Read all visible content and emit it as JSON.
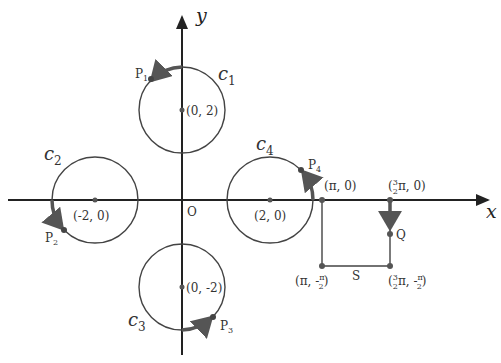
{
  "axes": {
    "x_label": "x",
    "y_label": "y",
    "origin_label": "O"
  },
  "circles": [
    {
      "name": "c",
      "sub": "1",
      "center_label": "(0, 2)",
      "point": "P",
      "point_sub": "1"
    },
    {
      "name": "c",
      "sub": "2",
      "center_label": "(-2, 0)",
      "point": "P",
      "point_sub": "2"
    },
    {
      "name": "c",
      "sub": "3",
      "center_label": "(0, -2)",
      "point": "P",
      "point_sub": "3"
    },
    {
      "name": "c",
      "sub": "4",
      "center_label": "(2, 0)",
      "point": "P",
      "point_sub": "4"
    }
  ],
  "rectangle": {
    "top_left": "(π, 0)",
    "top_right_pre": "(",
    "top_right_frac_num": "3",
    "top_right_frac_den": "2",
    "top_right_post": "π, 0)",
    "bottom_left_pre": "(π, -",
    "bottom_left_frac_num": "π",
    "bottom_left_frac_den": "2",
    "bottom_left_post": ")",
    "bottom_right_pre": "(",
    "bottom_right_frac_num": "3",
    "bottom_right_frac_den": "2",
    "bottom_right_mid": "π, -",
    "bottom_right_frac2_num": "π",
    "bottom_right_frac2_den": "2",
    "bottom_right_post": ")",
    "point_Q": "Q",
    "side_S": "S"
  },
  "colors": {
    "line": "#333333",
    "arc": "#555555"
  }
}
